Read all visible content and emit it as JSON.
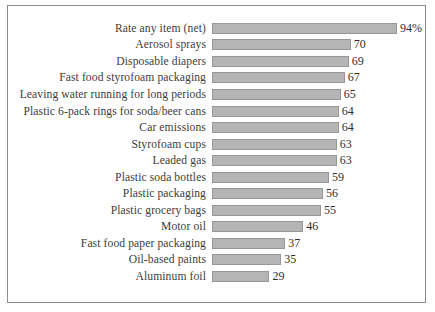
{
  "chart_data": {
    "type": "bar",
    "orientation": "horizontal",
    "title": "",
    "xlabel": "",
    "ylabel": "",
    "xlim": [
      0,
      106
    ],
    "grid": false,
    "legend": null,
    "bar_color": "#b5b5b5",
    "bar_border_color": "#979797",
    "categories": [
      "Rate any item (net)",
      "Aerosol sprays",
      "Disposable diapers",
      "Fast food styrofoam packaging",
      "Leaving water running for long periods",
      "Plastic 6-pack rings for soda/beer cans",
      "Car emissions",
      "Styrofoam cups",
      "Leaded gas",
      "Plastic soda bottles",
      "Plastic packaging",
      "Plastic grocery bags",
      "Motor oil",
      "Fast food paper packaging",
      "Oil-based paints",
      "Aluminum foil"
    ],
    "values": [
      94,
      70,
      69,
      67,
      65,
      64,
      64,
      63,
      63,
      59,
      56,
      55,
      46,
      37,
      35,
      29
    ],
    "value_labels": [
      "94%",
      "70",
      "69",
      "67",
      "65",
      "64",
      "64",
      "63",
      "63",
      "59",
      "56",
      "55",
      "46",
      "37",
      "35",
      "29"
    ]
  },
  "frame": {
    "border_color": "#8c8c8c",
    "background": "#ffffff"
  }
}
